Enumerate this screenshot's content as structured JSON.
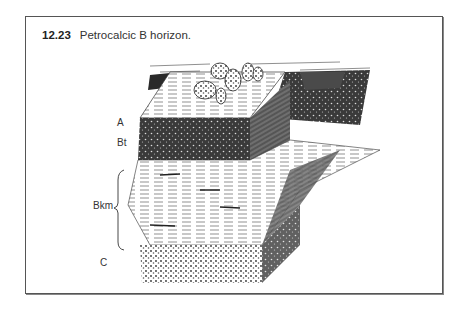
{
  "figure": {
    "number": "12.23",
    "title": "Petrocalcic B horizon.",
    "horizon_labels": [
      {
        "name": "A",
        "x": 117,
        "y": 122
      },
      {
        "name": "Bt",
        "x": 117,
        "y": 142
      },
      {
        "name": "Bkm",
        "x": 96,
        "y": 205
      },
      {
        "name": "C",
        "x": 100,
        "y": 262
      }
    ],
    "illustration": "soil-profile-block-diagram-with-cactus"
  }
}
